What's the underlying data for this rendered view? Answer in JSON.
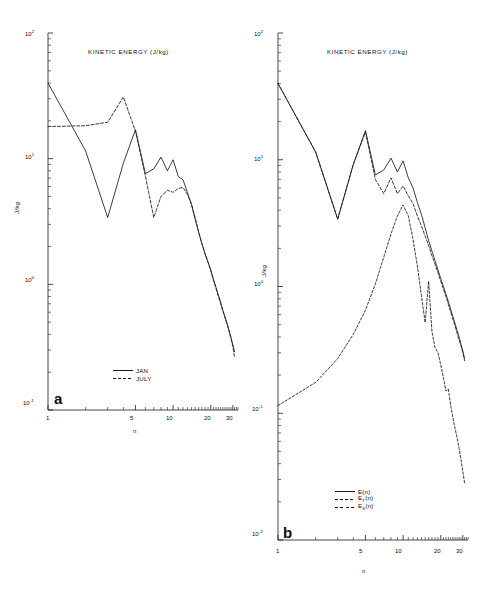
{
  "figure": {
    "background": "#ffffff",
    "line_color": "#1a1a1a"
  },
  "panels": [
    {
      "letter": "a",
      "title": "KINETIC ENERGY (J/kg)",
      "xlabel": "n",
      "ylabel": "J/kg",
      "xticks": [
        "1",
        "5",
        "10",
        "20",
        "30"
      ],
      "yticks": [
        "10",
        "10",
        "10",
        "10"
      ],
      "yticks_exp": [
        "2",
        "1",
        "0",
        "-1"
      ],
      "legend": [
        {
          "label": "JAN",
          "style": "solid"
        },
        {
          "label": "JULY",
          "style": "dashed"
        }
      ]
    },
    {
      "letter": "b",
      "title": "KINETIC ENERGY (J/kg)",
      "xlabel": "n",
      "ylabel": "J/kg",
      "xticks": [
        "1",
        "5",
        "10",
        "20",
        "30"
      ],
      "yticks": [
        "10",
        "10",
        "10",
        "10",
        "10"
      ],
      "yticks_exp": [
        "2",
        "1",
        "0",
        "-1",
        "-2"
      ],
      "legend": [
        {
          "label": "E(n)",
          "sub": "",
          "style": "solid"
        },
        {
          "label": "E",
          "sub": "T",
          "suffix": "(n)",
          "style": "dashed"
        },
        {
          "label": "E",
          "sub": "S",
          "suffix": "(n)",
          "style": "dashed2"
        }
      ]
    }
  ],
  "chart_data": [
    {
      "type": "line",
      "panel": "a",
      "title": "KINETIC ENERGY (J/kg)",
      "xlabel": "n",
      "ylabel": "J/kg",
      "xscale": "log",
      "yscale": "log",
      "xlim": [
        1,
        33
      ],
      "ylim": [
        0.1,
        100
      ],
      "legend_position": "lower-left",
      "grid": false,
      "x": [
        1,
        2,
        3,
        4,
        5,
        6,
        7,
        8,
        9,
        10,
        11,
        12,
        13,
        14,
        15,
        16,
        17,
        18,
        19,
        20,
        21,
        22,
        23,
        24,
        25,
        26,
        27,
        28,
        29,
        30,
        31
      ],
      "series": [
        {
          "name": "JAN",
          "style": "solid",
          "values": [
            40,
            11.5,
            3.4,
            9.2,
            17.0,
            7.6,
            8.3,
            10.3,
            8.0,
            9.8,
            7.2,
            6.8,
            5.4,
            4.3,
            3.3,
            2.6,
            2.1,
            1.75,
            1.5,
            1.3,
            1.1,
            0.95,
            0.82,
            0.72,
            0.62,
            0.55,
            0.49,
            0.43,
            0.38,
            0.33,
            0.29
          ]
        },
        {
          "name": "JULY",
          "style": "dashed",
          "values": [
            18.0,
            18.3,
            19.5,
            31.0,
            16.5,
            7.3,
            3.4,
            5.0,
            5.6,
            5.4,
            5.8,
            5.9,
            5.2,
            4.4,
            3.4,
            2.6,
            2.1,
            1.75,
            1.5,
            1.28,
            1.08,
            0.93,
            0.8,
            0.7,
            0.61,
            0.54,
            0.48,
            0.42,
            0.37,
            0.32,
            0.26
          ]
        }
      ]
    },
    {
      "type": "line",
      "panel": "b",
      "title": "KINETIC ENERGY (J/kg)",
      "xlabel": "n",
      "ylabel": "J/kg",
      "xscale": "log",
      "yscale": "log",
      "xlim": [
        1,
        33
      ],
      "ylim": [
        0.01,
        100
      ],
      "legend_position": "lower-right",
      "grid": false,
      "x": [
        1,
        2,
        3,
        4,
        5,
        6,
        7,
        8,
        9,
        10,
        11,
        12,
        13,
        14,
        15,
        16,
        17,
        18,
        19,
        20,
        21,
        22,
        23,
        24,
        25,
        26,
        27,
        28,
        29,
        30,
        31
      ],
      "series": [
        {
          "name": "E(n)",
          "style": "solid",
          "values": [
            40,
            11.5,
            3.4,
            9.2,
            17.0,
            7.6,
            8.3,
            10.3,
            8.0,
            9.8,
            7.2,
            6.0,
            4.6,
            3.7,
            2.9,
            2.3,
            1.9,
            1.6,
            1.35,
            1.15,
            1.0,
            0.87,
            0.76,
            0.66,
            0.58,
            0.51,
            0.45,
            0.4,
            0.35,
            0.31,
            0.27
          ]
        },
        {
          "name": "E_T(n)",
          "style": "dashed",
          "values": [
            40,
            11.5,
            3.4,
            9.2,
            16.5,
            7.0,
            5.4,
            7.2,
            5.4,
            6.2,
            5.2,
            4.5,
            3.6,
            3.0,
            2.5,
            2.1,
            1.75,
            1.5,
            1.28,
            1.1,
            0.95,
            0.83,
            0.72,
            0.63,
            0.55,
            0.49,
            0.43,
            0.38,
            0.34,
            0.3,
            0.26
          ]
        },
        {
          "name": "E_S(n)",
          "style": "dashed2",
          "values": [
            0.115,
            0.175,
            0.27,
            0.42,
            0.65,
            1.05,
            1.7,
            2.6,
            3.6,
            4.4,
            3.6,
            2.35,
            1.45,
            0.85,
            0.52,
            1.1,
            0.44,
            0.33,
            0.3,
            0.24,
            0.19,
            0.15,
            0.155,
            0.115,
            0.092,
            0.076,
            0.064,
            0.053,
            0.043,
            0.035,
            0.028
          ]
        }
      ]
    }
  ]
}
